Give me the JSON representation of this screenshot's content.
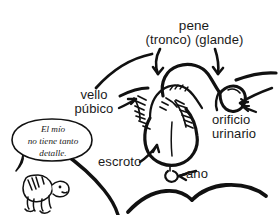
{
  "diagram": {
    "title_label": "pene",
    "subtitle_label": "(tronco) (glande)",
    "background_color": "#ffffff",
    "ink_color": "#111111",
    "text_color": "#1a1a1a",
    "labels": {
      "pene": "pene",
      "tronco_glande": "(tronco) (glande)",
      "vello_publico_line1": "vello",
      "vello_publico_line2": "púbico",
      "orificio_line1": "orificio",
      "orificio_line2": "urinario",
      "escroto": "escroto",
      "ano": "ano"
    },
    "speech_bubble": {
      "line1": "El mío",
      "line2": "no tiene tanto",
      "line3": "detalle."
    },
    "icons": {
      "character": "cartoon-creature-icon",
      "pointer_tronco": "curved-arrow-down-icon",
      "pointer_glande": "curved-arrow-down-icon",
      "pointer_orificio": "arrow-left-icon",
      "pointer_vello": "arrow-right-icon",
      "pointer_escroto": "arrow-up-icon",
      "pointer_ano": "arrow-left-icon"
    }
  }
}
